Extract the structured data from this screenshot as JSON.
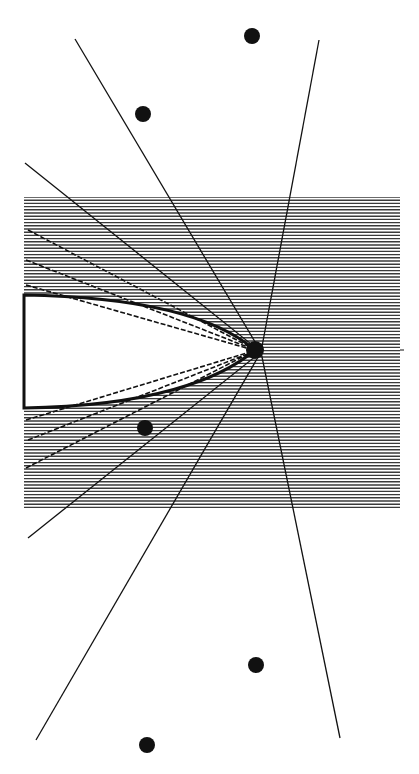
{
  "diagram": {
    "type": "ray-caustic-diagram",
    "background": "#ffffff",
    "ink": "#111111",
    "hatch_color": "#3a3a3a",
    "hatched_region": {
      "x1": 24,
      "y1": 197,
      "x2": 400,
      "y2": 510,
      "line_spacing": 3.2
    },
    "focus_point": {
      "x": 255,
      "y": 350,
      "r": 9
    },
    "cavity": {
      "upper_left_y": 295,
      "lower_left_y": 408,
      "apex": {
        "x": 255,
        "y": 350
      }
    },
    "dots": [
      {
        "x": 252,
        "y": 36,
        "r": 8
      },
      {
        "x": 143,
        "y": 114,
        "r": 8
      },
      {
        "x": 145,
        "y": 428,
        "r": 8
      },
      {
        "x": 256,
        "y": 665,
        "r": 8
      },
      {
        "x": 147,
        "y": 745,
        "r": 8
      }
    ],
    "rays": [
      {
        "x1": 75,
        "y1": 39,
        "x2": 261,
        "y2": 352
      },
      {
        "x1": 319,
        "y1": 40,
        "x2": 261,
        "y2": 352
      },
      {
        "x1": 25,
        "y1": 163,
        "x2": 261,
        "y2": 352
      },
      {
        "x1": 261,
        "y1": 352,
        "x2": 340,
        "y2": 738
      },
      {
        "x1": 261,
        "y1": 352,
        "x2": 28,
        "y2": 538
      },
      {
        "x1": 261,
        "y1": 352,
        "x2": 36,
        "y2": 740
      }
    ],
    "dashed_rays": [
      {
        "x1": 28,
        "y1": 230,
        "x2": 250,
        "y2": 347
      },
      {
        "x1": 26,
        "y1": 260,
        "x2": 250,
        "y2": 348
      },
      {
        "x1": 26,
        "y1": 285,
        "x2": 250,
        "y2": 349
      },
      {
        "x1": 26,
        "y1": 468,
        "x2": 250,
        "y2": 353
      },
      {
        "x1": 28,
        "y1": 440,
        "x2": 250,
        "y2": 353
      },
      {
        "x1": 26,
        "y1": 420,
        "x2": 250,
        "y2": 352
      }
    ]
  }
}
